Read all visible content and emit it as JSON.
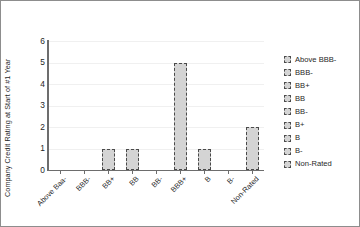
{
  "chart_data": {
    "type": "bar",
    "title": "",
    "xlabel": "",
    "ylabel": "Company Credit Rating at Start of #1 Year",
    "categories": [
      "Above Baa-",
      "BBB-",
      "BB+",
      "BB",
      "BB-",
      "BBB+",
      "B",
      "B-",
      "Non-Rated"
    ],
    "values": [
      0,
      0,
      1,
      1,
      0,
      5,
      1,
      0,
      2
    ],
    "ylim": [
      0,
      6
    ],
    "yticks": [
      0,
      1,
      2,
      3,
      4,
      5,
      6
    ],
    "ytick_labels": [
      "0",
      "1",
      "2",
      "3",
      "4",
      "5",
      "6"
    ],
    "grid": true,
    "legend_position": "right",
    "legend": [
      "Above BBB-",
      "BBB-",
      "BB+",
      "BB",
      "BB-",
      "B+",
      "B",
      "B-",
      "Non-Rated"
    ],
    "series": [
      {
        "name": "Company Credit Rating at Start of #1 Year",
        "values": [
          0,
          0,
          1,
          1,
          0,
          5,
          1,
          0,
          2
        ]
      }
    ],
    "colors": {
      "bar_fill": "#d4d4d4",
      "bar_edge": "#4a4a4a",
      "axis": "#6d6d6d",
      "grid": "#f0f0f0",
      "text": "#1f1f1f",
      "frame": "#8d8d8d",
      "background": "#ffffff"
    }
  }
}
